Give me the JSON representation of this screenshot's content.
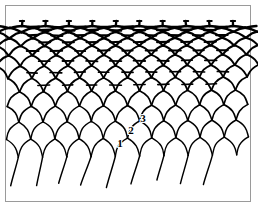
{
  "figure": {
    "background_color": "#ffffff",
    "line_color": "#000000",
    "frame_color": "#9a9a9a",
    "frame": {
      "x": 5,
      "y": 5,
      "width": 246,
      "height": 197
    }
  },
  "mesh": {
    "left": 22,
    "right": 233,
    "top": 26,
    "bottom": 156,
    "rows": 12,
    "columns": 9,
    "dash_rows": 8,
    "top_stub_count": 9,
    "fringe_count": 8,
    "fringe_bottom": 186
  },
  "callouts": [
    {
      "id": "1",
      "label": "1",
      "x": 120,
      "y": 147
    },
    {
      "id": "2",
      "label": "2",
      "x": 131,
      "y": 134
    },
    {
      "id": "3",
      "label": "3",
      "x": 143,
      "y": 122
    }
  ]
}
